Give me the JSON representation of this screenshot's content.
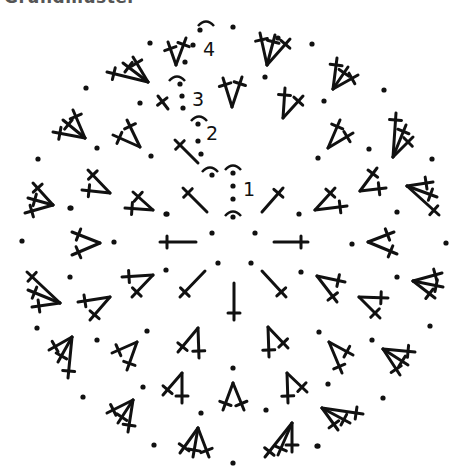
{
  "title": "Grundmuster",
  "diagram": {
    "type": "crochet-round-chart",
    "center_dots": [
      [
        212,
        233
      ],
      [
        255,
        233
      ],
      [
        218,
        263
      ],
      [
        251,
        263
      ]
    ],
    "round_markers": [
      {
        "label": "1",
        "label_pos": [
          243,
          196
        ],
        "arc_top": [
          233,
          166
        ],
        "dots": [
          [
            233,
            173
          ],
          [
            233,
            186
          ],
          [
            233,
            199
          ]
        ],
        "arc_bottom": [
          233,
          212
        ],
        "dot_bottom": [
          233,
          217
        ]
      },
      {
        "label": "2",
        "label_pos": [
          206,
          140
        ],
        "arc_top": [
          199,
          117
        ],
        "dots": [
          [
            198,
            124
          ],
          [
            198,
            141
          ],
          [
            201,
            154
          ]
        ],
        "arc_bottom": [
          210,
          168
        ],
        "dot_bottom": [
          212,
          175
        ]
      },
      {
        "label": "3",
        "label_pos": [
          192,
          106
        ],
        "arc_top": [
          177,
          77
        ],
        "dots": [
          [
            180,
            84
          ],
          [
            182,
            96
          ],
          [
            183,
            108
          ]
        ],
        "arc_bottom": null,
        "dot_bottom": null
      },
      {
        "label": "4",
        "label_pos": [
          203,
          56
        ],
        "arc_top": [
          206,
          22
        ],
        "dots": [
          [
            200,
            30
          ],
          [
            193,
            45
          ],
          [
            185,
            62
          ]
        ],
        "arc_bottom": null,
        "dot_bottom": null
      }
    ],
    "stitches": [
      {
        "round": 1,
        "base": [
          207,
          212
        ],
        "tips": [
          [
            183,
            188
          ]
        ]
      },
      {
        "round": 1,
        "base": [
          262,
          212
        ],
        "tips": [
          [
            283,
            188
          ]
        ]
      },
      {
        "round": 1,
        "base": [
          196,
          242
        ],
        "tips": [
          [
            160,
            242
          ]
        ]
      },
      {
        "round": 1,
        "base": [
          274,
          242
        ],
        "tips": [
          [
            308,
            242
          ]
        ]
      },
      {
        "round": 1,
        "base": [
          205,
          271
        ],
        "tips": [
          [
            180,
            297
          ]
        ]
      },
      {
        "round": 1,
        "base": [
          262,
          271
        ],
        "tips": [
          [
            286,
            297
          ]
        ]
      },
      {
        "round": 1,
        "base": [
          234,
          283
        ],
        "tips": [
          [
            234,
            320
          ]
        ]
      },
      {
        "round": 2,
        "base": [
          198,
          163
        ],
        "tips": [
          [
            175,
            140
          ]
        ]
      },
      {
        "round": 2,
        "base": [
          283,
          118
        ],
        "tips": [
          [
            285,
            88
          ],
          [
            303,
            96
          ]
        ]
      },
      {
        "round": 2,
        "base": [
          328,
          148
        ],
        "tips": [
          [
            340,
            120
          ],
          [
            353,
            133
          ]
        ]
      },
      {
        "round": 2,
        "base": [
          315,
          210
        ],
        "tips": [
          [
            335,
            188
          ],
          [
            347,
            206
          ]
        ]
      },
      {
        "round": 2,
        "base": [
          317,
          276
        ],
        "tips": [
          [
            345,
            282
          ],
          [
            337,
            302
          ]
        ]
      },
      {
        "round": 2,
        "base": [
          268,
          327
        ],
        "tips": [
          [
            269,
            357
          ],
          [
            288,
            348
          ]
        ]
      },
      {
        "round": 2,
        "base": [
          198,
          328
        ],
        "tips": [
          [
            178,
            352
          ],
          [
            199,
            358
          ]
        ]
      },
      {
        "round": 2,
        "base": [
          153,
          275
        ],
        "tips": [
          [
            122,
            277
          ],
          [
            132,
            297
          ]
        ]
      },
      {
        "round": 2,
        "base": [
          153,
          210
        ],
        "tips": [
          [
            133,
            192
          ],
          [
            125,
            208
          ]
        ]
      },
      {
        "round": 2,
        "base": [
          140,
          147
        ],
        "tips": [
          [
            113,
            135
          ],
          [
            127,
            120
          ]
        ]
      },
      {
        "round": 3,
        "base": [
          168,
          109
        ],
        "tips": [
          [
            158,
            96
          ]
        ]
      },
      {
        "round": 3,
        "base": [
          232,
          107
        ],
        "tips": [
          [
            223,
            78
          ],
          [
            242,
            77
          ]
        ]
      },
      {
        "round": 3,
        "base": [
          360,
          191
        ],
        "tips": [
          [
            377,
            168
          ],
          [
            386,
            188
          ]
        ]
      },
      {
        "round": 3,
        "base": [
          368,
          242
        ],
        "tips": [
          [
            394,
            232
          ],
          [
            397,
            254
          ]
        ]
      },
      {
        "round": 3,
        "base": [
          359,
          297
        ],
        "tips": [
          [
            388,
            298
          ],
          [
            380,
            318
          ]
        ]
      },
      {
        "round": 3,
        "base": [
          329,
          342
        ],
        "tips": [
          [
            353,
            355
          ],
          [
            342,
            373
          ]
        ]
      },
      {
        "round": 3,
        "base": [
          287,
          373
        ],
        "tips": [
          [
            288,
            403
          ],
          [
            307,
            392
          ]
        ]
      },
      {
        "round": 3,
        "base": [
          233,
          383
        ],
        "tips": [
          [
            223,
            410
          ],
          [
            244,
            410
          ]
        ]
      },
      {
        "round": 3,
        "base": [
          182,
          373
        ],
        "tips": [
          [
            163,
            395
          ],
          [
            182,
            403
          ]
        ]
      },
      {
        "round": 3,
        "base": [
          137,
          342
        ],
        "tips": [
          [
            112,
            353
          ],
          [
            127,
            370
          ]
        ]
      },
      {
        "round": 3,
        "base": [
          110,
          297
        ],
        "tips": [
          [
            78,
            302
          ],
          [
            90,
            320
          ]
        ]
      },
      {
        "round": 3,
        "base": [
          100,
          243
        ],
        "tips": [
          [
            72,
            232
          ],
          [
            72,
            255
          ]
        ]
      },
      {
        "round": 3,
        "base": [
          110,
          193
        ],
        "tips": [
          [
            88,
            170
          ],
          [
            82,
            190
          ]
        ]
      },
      {
        "round": 3,
        "base": [
          176,
          65
        ],
        "tips": [
          [
            168,
            42
          ],
          [
            186,
            38
          ]
        ]
      },
      {
        "round": 4,
        "base": [
          267,
          65
        ],
        "tips": [
          [
            260,
            33
          ],
          [
            275,
            35
          ],
          [
            290,
            39
          ]
        ]
      },
      {
        "round": 4,
        "base": [
          333,
          89
        ],
        "tips": [
          [
            337,
            58
          ],
          [
            348,
            67
          ],
          [
            358,
            75
          ]
        ]
      },
      {
        "round": 4,
        "base": [
          393,
          157
        ],
        "tips": [
          [
            396,
            113
          ],
          [
            406,
            125
          ],
          [
            413,
            137
          ]
        ]
      },
      {
        "round": 4,
        "base": [
          407,
          186
        ],
        "tips": [
          [
            433,
            182
          ],
          [
            437,
            197
          ],
          [
            439,
            215
          ]
        ]
      },
      {
        "round": 4,
        "base": [
          413,
          281
        ],
        "tips": [
          [
            442,
            273
          ],
          [
            443,
            287
          ],
          [
            435,
            298
          ]
        ]
      },
      {
        "round": 4,
        "base": [
          383,
          349
        ],
        "tips": [
          [
            415,
            352
          ],
          [
            408,
            365
          ],
          [
            400,
            375
          ]
        ]
      },
      {
        "round": 4,
        "base": [
          322,
          408
        ],
        "tips": [
          [
            363,
            414
          ],
          [
            350,
            423
          ],
          [
            338,
            430
          ]
        ]
      },
      {
        "round": 4,
        "base": [
          292,
          423
        ],
        "tips": [
          [
            265,
            457
          ],
          [
            278,
            455
          ],
          [
            292,
            452
          ]
        ]
      },
      {
        "round": 4,
        "base": [
          198,
          428
        ],
        "tips": [
          [
            180,
            453
          ],
          [
            193,
            457
          ],
          [
            209,
            457
          ]
        ]
      },
      {
        "round": 4,
        "base": [
          133,
          400
        ],
        "tips": [
          [
            107,
            413
          ],
          [
            118,
            423
          ],
          [
            128,
            432
          ]
        ]
      },
      {
        "round": 4,
        "base": [
          72,
          337
        ],
        "tips": [
          [
            49,
            350
          ],
          [
            58,
            362
          ],
          [
            68,
            378
          ]
        ]
      },
      {
        "round": 4,
        "base": [
          60,
          303
        ],
        "tips": [
          [
            27,
            272
          ],
          [
            28,
            290
          ],
          [
            32,
            307
          ]
        ]
      },
      {
        "round": 4,
        "base": [
          53,
          205
        ],
        "tips": [
          [
            33,
            183
          ],
          [
            28,
            198
          ],
          [
            25,
            213
          ]
        ]
      },
      {
        "round": 4,
        "base": [
          85,
          138
        ],
        "tips": [
          [
            53,
            132
          ],
          [
            63,
            120
          ],
          [
            73,
            110
          ]
        ]
      },
      {
        "round": 4,
        "base": [
          148,
          82
        ],
        "tips": [
          [
            107,
            72
          ],
          [
            123,
            63
          ],
          [
            133,
            57
          ]
        ]
      }
    ],
    "chain_dots": [
      [
        233,
        27
      ],
      [
        312,
        44
      ],
      [
        265,
        77
      ],
      [
        384,
        90
      ],
      [
        324,
        101
      ],
      [
        369,
        149
      ],
      [
        318,
        158
      ],
      [
        432,
        159
      ],
      [
        397,
        212
      ],
      [
        299,
        214
      ],
      [
        352,
        244
      ],
      [
        446,
        243
      ],
      [
        397,
        277
      ],
      [
        301,
        272
      ],
      [
        430,
        326
      ],
      [
        372,
        340
      ],
      [
        319,
        332
      ],
      [
        328,
        384
      ],
      [
        383,
        398
      ],
      [
        318,
        446
      ],
      [
        233,
        368
      ],
      [
        201,
        413
      ],
      [
        266,
        410
      ],
      [
        154,
        445
      ],
      [
        233,
        463
      ],
      [
        317,
        446
      ],
      [
        37,
        328
      ],
      [
        97,
        340
      ],
      [
        147,
        331
      ],
      [
        83,
        397
      ],
      [
        143,
        387
      ],
      [
        22,
        241
      ],
      [
        70,
        208
      ],
      [
        114,
        242
      ],
      [
        70,
        277
      ],
      [
        166,
        214
      ],
      [
        166,
        270
      ],
      [
        150,
        43
      ],
      [
        86,
        88
      ],
      [
        140,
        103
      ],
      [
        97,
        148
      ],
      [
        151,
        156
      ],
      [
        38,
        159
      ],
      [
        71,
        208
      ],
      [
        167,
        214
      ],
      [
        278,
        38
      ]
    ]
  }
}
